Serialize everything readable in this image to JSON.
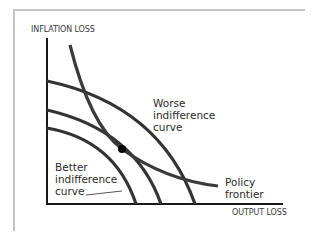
{
  "diagram": {
    "y_axis_label": "INFLATION LOSS",
    "x_axis_label": "OUTPUT LOSS",
    "labels": {
      "worse": [
        "Worse",
        "indifference",
        "curve"
      ],
      "better": [
        "Better",
        "indifference",
        "curve"
      ],
      "policy": [
        "Policy",
        "frontier"
      ]
    },
    "colors": {
      "curve": "#333333",
      "axis": "#1a1a1a",
      "frame": "#c4c4c4",
      "point": "#000000"
    },
    "curves": [
      {
        "name": "worse-indifference-curve",
        "from": [
          47,
          81
        ],
        "to": [
          195,
          204
        ]
      },
      {
        "name": "middle-indifference-curve",
        "from": [
          47,
          110
        ],
        "to": [
          161,
          204
        ],
        "passes_through_point": true
      },
      {
        "name": "better-indifference-curve",
        "from": [
          47,
          128
        ],
        "to": [
          136,
          204
        ]
      },
      {
        "name": "policy-frontier",
        "from": [
          70,
          45
        ],
        "to": [
          218,
          187
        ]
      }
    ],
    "optimal_point": [
      122,
      149
    ]
  }
}
